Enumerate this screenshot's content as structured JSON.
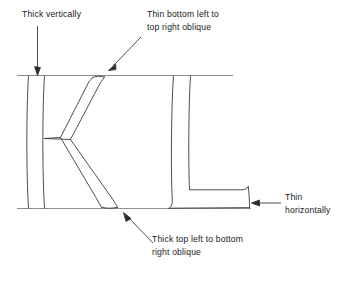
{
  "figure": {
    "background_color": "#ffffff",
    "stroke_color": "#333333",
    "guide_color": "#8a8a8a",
    "text_color": "#1a1a1a",
    "glyphs": [
      "K",
      "L"
    ]
  },
  "annotations": {
    "thick_vertically": {
      "lines": [
        "Thick vertically"
      ],
      "arrow": "down-arrow",
      "target": "vertical-stem-of-K"
    },
    "thin_oblique_up": {
      "lines": [
        "Thin bottom left to",
        "top right oblique"
      ],
      "arrow": "down-left-arrow",
      "target": "upper-arm-of-K"
    },
    "thin_horizontally": {
      "lines": [
        "Thin",
        "horizontally"
      ],
      "arrow": "left-arrow",
      "target": "foot-of-L"
    },
    "thick_oblique_down": {
      "lines": [
        "Thick top left to bottom",
        "right oblique"
      ],
      "arrow": "up-left-arrow",
      "target": "lower-leg-of-K"
    }
  },
  "guides": {
    "cap_line_label": "cap-line",
    "base_line_label": "base-line"
  }
}
